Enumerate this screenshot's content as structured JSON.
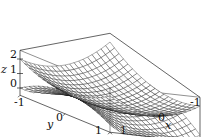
{
  "chart_data": {
    "type": "surface3d",
    "title": "",
    "surfaces": [
      {
        "name": "upper",
        "expression": "z = x^2 + y^2",
        "description": "upward-opening paraboloid mesh"
      },
      {
        "name": "lower",
        "expression": "z = x^2 - y^2",
        "description": "saddle-shaped mesh (clipped to box)"
      }
    ],
    "x": {
      "label": "x",
      "ticks": [
        "-1",
        "0",
        "1"
      ],
      "range": [
        -1,
        1
      ]
    },
    "y": {
      "label": "y",
      "ticks": [
        "-1",
        "0",
        "1"
      ],
      "range": [
        -1,
        1
      ]
    },
    "z": {
      "label": "z",
      "ticks": [
        "0",
        "1",
        "2"
      ],
      "range": [
        -0.5,
        2.6
      ]
    },
    "grid_lines_per_axis": 21,
    "box": true,
    "colors": {
      "mesh": "#111111",
      "face": "#ffffff",
      "axes": "#222222"
    }
  }
}
